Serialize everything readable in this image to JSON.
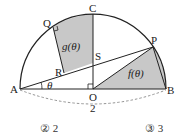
{
  "diagram": {
    "points": {
      "A": {
        "label": "A",
        "x": 20,
        "y": 89
      },
      "B": {
        "label": "B",
        "x": 166,
        "y": 89
      },
      "O": {
        "label": "O",
        "x": 93,
        "y": 89
      },
      "C": {
        "label": "C",
        "x": 93,
        "y": 14
      },
      "P": {
        "label": "P",
        "x": 153,
        "y": 47
      },
      "Q": {
        "label": "Q",
        "x": 53,
        "y": 27
      },
      "R": {
        "label": "R",
        "x": 64,
        "y": 73
      },
      "S": {
        "label": "S",
        "x": 93,
        "y": 63
      }
    },
    "angle_label": "θ",
    "region_f_label": "f(θ)",
    "region_g_label": "g(θ)",
    "length_label": "2",
    "colors": {
      "shade": "#c8c8c8",
      "line": "#222222",
      "dash": "#888888"
    }
  },
  "choices": [
    {
      "label": "② 2"
    },
    {
      "label": "③ 3"
    }
  ]
}
